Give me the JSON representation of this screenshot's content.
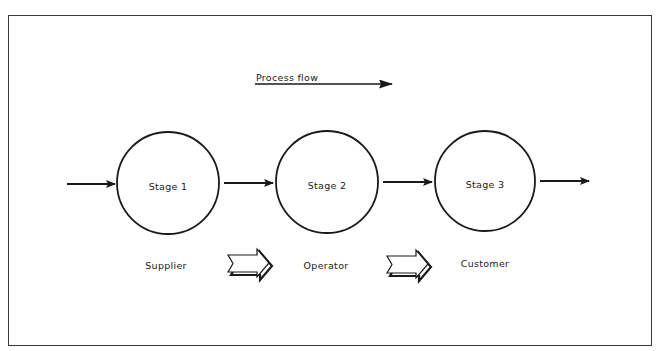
{
  "diagram": {
    "title": "Process flow",
    "stages": [
      {
        "label": "Stage 1",
        "role": "Supplier"
      },
      {
        "label": "Stage 2",
        "role": "Operator"
      },
      {
        "label": "Stage 3",
        "role": "Customer"
      }
    ],
    "connectors": [
      {
        "from": "input",
        "to": "Stage 1",
        "type": "arrow"
      },
      {
        "from": "Stage 1",
        "to": "Stage 2",
        "type": "arrow"
      },
      {
        "from": "Stage 2",
        "to": "Stage 3",
        "type": "arrow"
      },
      {
        "from": "Stage 3",
        "to": "output",
        "type": "arrow"
      }
    ],
    "role_transitions": [
      {
        "from": "Supplier",
        "to": "Operator",
        "type": "block-arrow"
      },
      {
        "from": "Operator",
        "to": "Customer",
        "type": "block-arrow"
      }
    ],
    "colors": {
      "stroke": "#1a1a1a",
      "background": "#ffffff"
    }
  }
}
